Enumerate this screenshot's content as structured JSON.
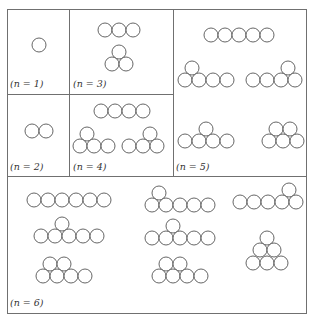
{
  "figure": {
    "panels": [
      {
        "id": "n1",
        "label": "(n = 1)",
        "circles": [
          [
            39,
            45
          ]
        ]
      },
      {
        "id": "n2",
        "label": "(n = 2)",
        "circles": [
          [
            32,
            131
          ],
          [
            46,
            131
          ]
        ]
      },
      {
        "id": "n3",
        "label": "(n = 3)",
        "circles": [
          [
            105,
            30
          ],
          [
            119,
            30
          ],
          [
            133,
            30
          ],
          [
            119,
            52
          ],
          [
            112,
            64
          ],
          [
            126,
            64
          ]
        ]
      },
      {
        "id": "n4",
        "label": "(n = 4)",
        "circles": [
          [
            101,
            111
          ],
          [
            115,
            111
          ],
          [
            129,
            111
          ],
          [
            143,
            111
          ],
          [
            87,
            134
          ],
          [
            80,
            146
          ],
          [
            94,
            146
          ],
          [
            108,
            146
          ],
          [
            150,
            134
          ],
          [
            129,
            146
          ],
          [
            143,
            146
          ],
          [
            157,
            146
          ]
        ]
      },
      {
        "id": "n5",
        "label": "(n = 5)",
        "circles": [
          [
            211,
            35
          ],
          [
            225,
            35
          ],
          [
            239,
            35
          ],
          [
            253,
            35
          ],
          [
            267,
            35
          ],
          [
            192,
            68
          ],
          [
            185,
            80
          ],
          [
            199,
            80
          ],
          [
            213,
            80
          ],
          [
            227,
            80
          ],
          [
            288,
            68
          ],
          [
            253,
            80
          ],
          [
            267,
            80
          ],
          [
            281,
            80
          ],
          [
            295,
            80
          ],
          [
            206,
            129
          ],
          [
            185,
            141
          ],
          [
            199,
            141
          ],
          [
            213,
            141
          ],
          [
            227,
            141
          ],
          [
            276,
            129
          ],
          [
            290,
            129
          ],
          [
            269,
            141
          ],
          [
            283,
            141
          ],
          [
            297,
            141
          ]
        ]
      },
      {
        "id": "n6",
        "label": "(n = 6)",
        "circles": [
          [
            34,
            200
          ],
          [
            48,
            200
          ],
          [
            62,
            200
          ],
          [
            76,
            200
          ],
          [
            90,
            200
          ],
          [
            104,
            200
          ],
          [
            62,
            224
          ],
          [
            41,
            236
          ],
          [
            55,
            236
          ],
          [
            69,
            236
          ],
          [
            83,
            236
          ],
          [
            97,
            236
          ],
          [
            50,
            264
          ],
          [
            64,
            264
          ],
          [
            43,
            276
          ],
          [
            57,
            276
          ],
          [
            71,
            276
          ],
          [
            85,
            276
          ],
          [
            159,
            193
          ],
          [
            152,
            205
          ],
          [
            166,
            205
          ],
          [
            180,
            205
          ],
          [
            194,
            205
          ],
          [
            208,
            205
          ],
          [
            173,
            226
          ],
          [
            152,
            238
          ],
          [
            166,
            238
          ],
          [
            180,
            238
          ],
          [
            194,
            238
          ],
          [
            208,
            238
          ],
          [
            166,
            264
          ],
          [
            180,
            264
          ],
          [
            159,
            276
          ],
          [
            173,
            276
          ],
          [
            187,
            276
          ],
          [
            201,
            276
          ],
          [
            289,
            190
          ],
          [
            240,
            202
          ],
          [
            254,
            202
          ],
          [
            268,
            202
          ],
          [
            282,
            202
          ],
          [
            296,
            202
          ],
          [
            267,
            238
          ],
          [
            260,
            250
          ],
          [
            274,
            250
          ],
          [
            253,
            263
          ],
          [
            267,
            263
          ],
          [
            281,
            263
          ]
        ]
      }
    ],
    "labels": {
      "n1": {
        "text": "(n = 1)",
        "x": 10,
        "y": 87
      },
      "n2": {
        "text": "(n = 2)",
        "x": 10,
        "y": 170
      },
      "n3": {
        "text": "(n = 3)",
        "x": 73,
        "y": 87
      },
      "n4": {
        "text": "(n = 4)",
        "x": 73,
        "y": 170
      },
      "n5": {
        "text": "(n = 5)",
        "x": 176,
        "y": 170
      },
      "n6": {
        "text": "(n = 6)",
        "x": 10,
        "y": 306
      }
    },
    "grid": {
      "outer": [
        7,
        9,
        306,
        313
      ],
      "lines": [
        [
          69,
          9,
          69,
          176
        ],
        [
          173,
          9,
          173,
          176
        ],
        [
          7,
          94,
          173,
          94
        ],
        [
          7,
          176,
          306,
          176
        ]
      ]
    },
    "radius": 7
  }
}
